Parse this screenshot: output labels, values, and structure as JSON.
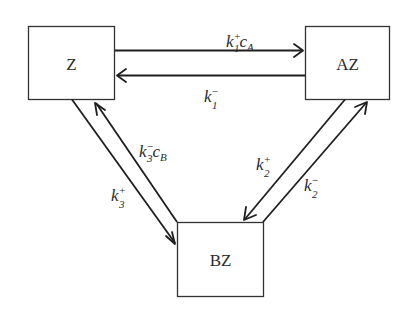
{
  "diagram": {
    "type": "reaction-network",
    "nodes": [
      {
        "id": "Z",
        "label": "Z"
      },
      {
        "id": "AZ",
        "label": "AZ"
      },
      {
        "id": "BZ",
        "label": "BZ"
      }
    ],
    "edges": [
      {
        "from": "Z",
        "to": "AZ",
        "rate": {
          "base": "k",
          "sup": "+",
          "sub": "1",
          "factor": "c",
          "factor_sub": "A"
        }
      },
      {
        "from": "AZ",
        "to": "Z",
        "rate": {
          "base": "k",
          "sup": "−",
          "sub": "1"
        }
      },
      {
        "from": "AZ",
        "to": "BZ",
        "rate": {
          "base": "k",
          "sup": "+",
          "sub": "2"
        }
      },
      {
        "from": "BZ",
        "to": "AZ",
        "rate": {
          "base": "k",
          "sup": "−",
          "sub": "2"
        }
      },
      {
        "from": "Z",
        "to": "BZ",
        "rate": {
          "base": "k",
          "sup": "+",
          "sub": "3"
        }
      },
      {
        "from": "BZ",
        "to": "Z",
        "rate": {
          "base": "k",
          "sup": "−",
          "sub": "3",
          "factor": "c",
          "factor_sub": "B"
        }
      }
    ]
  },
  "colors": {
    "line": "#1e1e1e",
    "box_border": "#333333",
    "text": "#2a2a2a",
    "background": "#ffffff"
  }
}
